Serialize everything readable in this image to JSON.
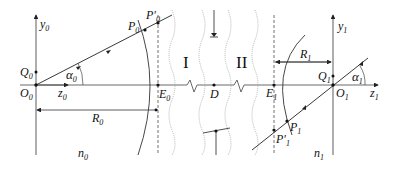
{
  "diagram": {
    "type": "optical-system-schematic",
    "colors": {
      "line": "#222222",
      "axis": "#333333",
      "wavy": "#888888"
    },
    "labels": {
      "y0": "y",
      "y0_sub": "0",
      "Q0": "Q",
      "Q0_sub": "0",
      "O0": "O",
      "O0_sub": "0",
      "z0": "z",
      "z0_sub": "0",
      "alpha0": "α",
      "alpha0_sub": "0",
      "P0": "P",
      "P0_sub": "0",
      "P0p": "P′",
      "P0p_sub": "0",
      "E0": "E",
      "E0_sub": "0",
      "R0": "R",
      "R0_sub": "0",
      "n0": "n",
      "n0_sub": "0",
      "region1": "I",
      "region2": "II",
      "D": "D",
      "E1": "E",
      "E1_sub": "1",
      "R1": "R",
      "R1_sub": "1",
      "y1": "y",
      "y1_sub": "1",
      "Q1": "Q",
      "Q1_sub": "1",
      "alpha1": "α",
      "alpha1_sub": "1",
      "O1": "O",
      "O1_sub": "1",
      "z1": "z",
      "z1_sub": "1",
      "P1": "P",
      "P1_sub": "1",
      "P1p": "P′",
      "P1p_sub": "1",
      "n1": "n",
      "n1_sub": "1"
    }
  }
}
